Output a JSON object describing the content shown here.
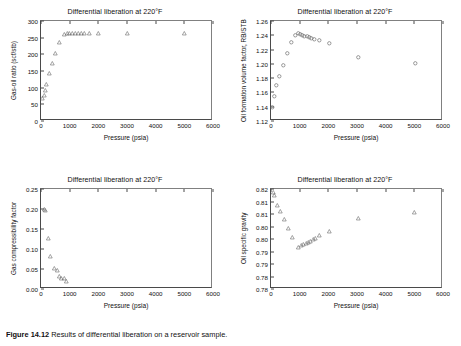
{
  "figure": {
    "caption_prefix": "Figure 14.12",
    "caption_text": "Results of differential liberation on a reservoir sample."
  },
  "common": {
    "title": "Differential liberation at 220°F",
    "xlabel": "Pressure (psia)",
    "xticks": [
      "0",
      "1000",
      "2000",
      "3000",
      "4000",
      "5000",
      "6000"
    ],
    "xlim": [
      0,
      6000
    ]
  },
  "chart_data": [
    {
      "id": "gas-oil-ratio",
      "type": "scatter",
      "title": "Differential liberation at 220°F",
      "xlabel": "Pressure (psia)",
      "ylabel": "Gas-oil ratio (scf/stb)",
      "xlim": [
        0,
        6000
      ],
      "ylim": [
        0,
        300
      ],
      "xticks": [
        "0",
        "1000",
        "2000",
        "3000",
        "4000",
        "5000",
        "6000"
      ],
      "yticks": [
        "0",
        "50",
        "100",
        "150",
        "200",
        "250",
        "300"
      ],
      "marker": "open-triangle",
      "grid": false,
      "legend": "none",
      "x": [
        60,
        100,
        160,
        200,
        300,
        400,
        500,
        640,
        800,
        900,
        1000,
        1100,
        1200,
        1300,
        1400,
        1500,
        1700,
        2000,
        3000,
        5000
      ],
      "y": [
        68,
        77,
        91,
        111,
        142,
        172,
        204,
        237,
        261,
        263,
        263,
        263,
        263,
        263,
        263,
        263,
        263,
        263,
        264,
        262
      ]
    },
    {
      "id": "oil-formation-volume-factor",
      "type": "scatter",
      "title": "Differential liberation at 220°F",
      "xlabel": "Pressure (psia)",
      "ylabel": "Oil formation volume factor, RB/STB",
      "xlim": [
        0,
        6000
      ],
      "ylim": [
        1.12,
        1.26
      ],
      "xticks": [
        "0",
        "1000",
        "2000",
        "3000",
        "4000",
        "5000",
        "6000"
      ],
      "yticks": [
        "1.12",
        "1.14",
        "1.16",
        "1.18",
        "1.20",
        "1.22",
        "1.24",
        "1.26"
      ],
      "marker": "open-circle",
      "grid": false,
      "legend": "none",
      "x": [
        60,
        110,
        200,
        300,
        420,
        560,
        700,
        840,
        960,
        1030,
        1100,
        1170,
        1250,
        1330,
        1420,
        1520,
        1700,
        2050,
        3050,
        5020
      ],
      "y": [
        1.139,
        1.154,
        1.17,
        1.183,
        1.198,
        1.215,
        1.23,
        1.24,
        1.243,
        1.242,
        1.24,
        1.239,
        1.238,
        1.237,
        1.236,
        1.234,
        1.233,
        1.229,
        1.209,
        1.201
      ]
    },
    {
      "id": "gas-compressibility-factor",
      "type": "scatter",
      "title": "Differential liberation at 220°F",
      "xlabel": "Pressure (psia)",
      "ylabel": "Gas compressibility factor",
      "xlim": [
        0,
        6000
      ],
      "ylim": [
        0.0,
        0.25
      ],
      "xticks": [
        "0",
        "1000",
        "2000",
        "3000",
        "4000",
        "5000",
        "6000"
      ],
      "yticks": [
        "0.00",
        "0.05",
        "0.10",
        "0.15",
        "0.20",
        "0.25"
      ],
      "marker": "open-triangle",
      "grid": false,
      "legend": "none",
      "x": [
        120,
        150,
        250,
        340,
        470,
        560,
        640,
        720,
        820,
        880
      ],
      "y": [
        0.199,
        0.198,
        0.128,
        0.081,
        0.051,
        0.046,
        0.033,
        0.027,
        0.026,
        0.019
      ]
    },
    {
      "id": "oil-specific-gravity",
      "type": "scatter",
      "title": "Differential liberation at 220°F",
      "xlabel": "Pressure (psia)",
      "ylabel": "Oil specific gravity",
      "xlim": [
        0,
        6000
      ],
      "ylim": [
        0.78,
        0.82
      ],
      "xticks": [
        "0",
        "1000",
        "2000",
        "3000",
        "4000",
        "5000",
        "6000"
      ],
      "yticks": [
        "0.78",
        "0.78",
        "0.79",
        "0.79",
        "0.80",
        "0.80",
        "0.81",
        "0.81",
        "0.82"
      ],
      "marker": "open-triangle",
      "grid": false,
      "legend": "none",
      "x": [
        70,
        130,
        230,
        330,
        460,
        600,
        760,
        960,
        1060,
        1140,
        1220,
        1300,
        1380,
        1460,
        1560,
        1700,
        2030,
        3060,
        5010
      ],
      "y": [
        0.8188,
        0.8173,
        0.8135,
        0.811,
        0.8077,
        0.8043,
        0.8005,
        0.7968,
        0.7973,
        0.7978,
        0.7982,
        0.7987,
        0.7992,
        0.7998,
        0.8004,
        0.8013,
        0.803,
        0.8082,
        0.8105
      ]
    }
  ]
}
